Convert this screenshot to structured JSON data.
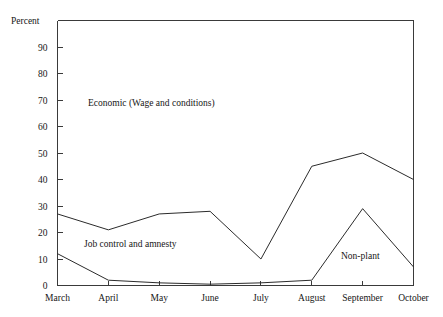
{
  "chart_data": {
    "type": "line",
    "title": "",
    "subtitle": "",
    "xlabel": "",
    "ylabel": "Percent",
    "ylabel_position": "top-left-above-axis",
    "categories": [
      "March",
      "April",
      "May",
      "June",
      "July",
      "August",
      "September",
      "October"
    ],
    "x": [
      0,
      1,
      2,
      3,
      4,
      5,
      6,
      7
    ],
    "ylim": [
      0,
      100
    ],
    "xlim": [
      0,
      7
    ],
    "y_ticks": [
      0,
      10,
      20,
      30,
      40,
      50,
      60,
      70,
      80,
      90
    ],
    "y_tick_labels": [
      "0",
      "10",
      "20",
      "30",
      "40",
      "50",
      "60",
      "70",
      "80",
      "90"
    ],
    "x_tick_labels": [
      "March",
      "April",
      "May",
      "June",
      "July",
      "August",
      "September",
      "October"
    ],
    "grid": false,
    "legend": "inline-annotations",
    "legend_position": "inside-plot",
    "series": [
      {
        "name": "Economic (Wage and conditions)",
        "values": [
          27,
          21,
          27,
          28,
          10,
          45,
          50,
          40
        ],
        "color": "#2b2b2b"
      },
      {
        "name": "Non-plant",
        "values": [
          12,
          2,
          1,
          0.5,
          1,
          2,
          29,
          7
        ],
        "color": "#2b2b2b"
      }
    ],
    "annotations": [
      {
        "text": "Economic (Wage and conditions)",
        "x_px": 88,
        "y_px": 106,
        "refers_to": "Economic (Wage and conditions)"
      },
      {
        "text": "Job control and amnesty",
        "x_px": 84,
        "y_px": 247,
        "refers_to": "Job control and amnesty"
      },
      {
        "text": "Non-plant",
        "x_px": 341,
        "y_px": 259,
        "refers_to": "Non-plant"
      }
    ]
  },
  "axes": {
    "y_axis_title": "Percent",
    "y_labels": [
      "90",
      "80",
      "70",
      "60",
      "50",
      "40",
      "30",
      "20",
      "10",
      "0"
    ],
    "x_labels": [
      "March",
      "April",
      "May",
      "June",
      "July",
      "August",
      "September",
      "October"
    ]
  },
  "annotations": {
    "economic": "Economic (Wage and conditions)",
    "job_control": "Job control and amnesty",
    "non_plant": "Non-plant"
  },
  "colors": {
    "line": "#2b2b2b",
    "axis": "#3a3a3a",
    "text": "#161616",
    "background": "#ffffff"
  }
}
